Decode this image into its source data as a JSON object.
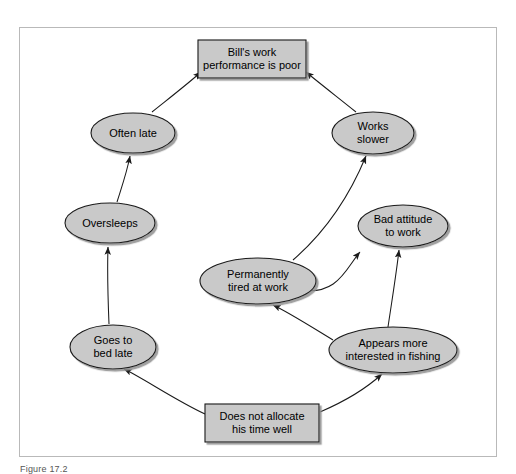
{
  "figure": {
    "caption": "Figure 17.2",
    "frame": {
      "x": 19,
      "y": 27,
      "width": 478,
      "height": 430
    },
    "colors": {
      "node_fill": "#c9c9c9",
      "node_stroke": "#1a1a1a",
      "node_shadow": "#9a9a9a",
      "arrow": "#1a1a1a",
      "frame_border": "#b9b9b9",
      "background": "#ffffff",
      "text": "#000000"
    }
  },
  "diagram": {
    "type": "causal-loop",
    "nodes": [
      {
        "id": "performance",
        "label": "Bill's work\nperformance is poor",
        "shape": "rect",
        "cx": 252,
        "cy": 59,
        "rx": 54,
        "ry": 19
      },
      {
        "id": "often-late",
        "label": "Often late",
        "shape": "ellipse",
        "cx": 133,
        "cy": 133,
        "rx": 42,
        "ry": 20
      },
      {
        "id": "works-slower",
        "label": "Works\nslower",
        "shape": "ellipse",
        "cx": 373,
        "cy": 133,
        "rx": 41,
        "ry": 21
      },
      {
        "id": "oversleeps",
        "label": "Oversleeps",
        "shape": "ellipse",
        "cx": 110,
        "cy": 223,
        "rx": 45,
        "ry": 20
      },
      {
        "id": "bad-attitude",
        "label": "Bad attitude\nto work",
        "shape": "ellipse",
        "cx": 403,
        "cy": 226,
        "rx": 45,
        "ry": 21
      },
      {
        "id": "permanently-tired",
        "label": "Permanently\ntired at work",
        "shape": "ellipse",
        "cx": 258,
        "cy": 281,
        "rx": 58,
        "ry": 23
      },
      {
        "id": "goes-to-bed-late",
        "label": "Goes to\nbed late",
        "shape": "ellipse",
        "cx": 113,
        "cy": 347,
        "rx": 43,
        "ry": 22
      },
      {
        "id": "fishing",
        "label": "Appears more\ninterested in fishing",
        "shape": "ellipse",
        "cx": 393,
        "cy": 350,
        "rx": 64,
        "ry": 23
      },
      {
        "id": "time-allocation",
        "label": "Does not allocate\nhis time well",
        "shape": "rect",
        "cx": 262,
        "cy": 423,
        "rx": 57,
        "ry": 19
      }
    ],
    "edges": [
      {
        "from": "often-late",
        "to": "performance",
        "path": "M 152 112 C 172 96 190 82 201 72"
      },
      {
        "from": "works-slower",
        "to": "performance",
        "path": "M 356 112 C 336 96 318 82 306 72"
      },
      {
        "from": "oversleeps",
        "to": "often-late",
        "path": "M 117 202 C 122 186 127 172 130 156"
      },
      {
        "from": "goes-to-bed-late",
        "to": "oversleeps",
        "path": "M 109 324 C 108 300 107 276 108 247"
      },
      {
        "from": "time-allocation",
        "to": "goes-to-bed-late",
        "path": "M 205 414 C 175 400 143 378 124 369"
      },
      {
        "from": "time-allocation",
        "to": "fishing",
        "path": "M 320 412 C 348 400 370 385 382 374"
      },
      {
        "from": "fishing",
        "to": "permanently-tired",
        "path": "M 333 340 C 310 326 288 312 273 305"
      },
      {
        "from": "permanently-tired",
        "to": "works-slower",
        "path": "M 293 260 C 330 228 352 190 366 156"
      },
      {
        "from": "permanently-tired",
        "to": "bad-attitude",
        "path": "M 316 284 C 340 282 352 266 360 252"
      },
      {
        "from": "fishing",
        "to": "bad-attitude",
        "path": "M 388 327 C 392 300 396 276 399 250"
      }
    ]
  }
}
